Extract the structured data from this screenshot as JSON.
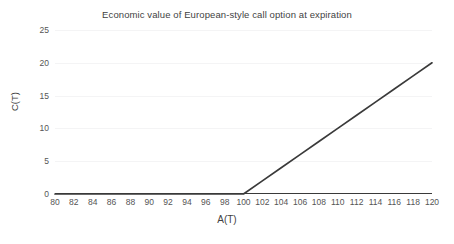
{
  "chart_data": {
    "type": "line",
    "title": "Economic value of European-style call option at expiration",
    "xlabel": "A(T)",
    "ylabel": "C(T)",
    "xlim": [
      80,
      120
    ],
    "ylim": [
      0,
      25
    ],
    "grid": true,
    "legend": null,
    "xticks": [
      80,
      82,
      84,
      86,
      88,
      90,
      92,
      94,
      96,
      98,
      100,
      102,
      104,
      106,
      108,
      110,
      112,
      114,
      116,
      118,
      120
    ],
    "yticks": [
      0,
      5,
      10,
      15,
      20,
      25
    ],
    "series": [
      {
        "name": "C(T) = max(A(T) - 100, 0)",
        "color": "#3a3a3a",
        "x": [
          80,
          82,
          84,
          86,
          88,
          90,
          92,
          94,
          96,
          98,
          100,
          102,
          104,
          106,
          108,
          110,
          112,
          114,
          116,
          118,
          120
        ],
        "values": [
          0,
          0,
          0,
          0,
          0,
          0,
          0,
          0,
          0,
          0,
          0,
          2,
          4,
          6,
          8,
          10,
          12,
          14,
          16,
          18,
          20
        ]
      }
    ],
    "annotations": {
      "strike": 100,
      "kink_point": [
        100,
        0
      ],
      "end_point": [
        120,
        20
      ]
    }
  },
  "colors": {
    "background": "#ffffff",
    "line": "#3a3a3a",
    "grid": "#f4f4f5",
    "axis": "#3a3a3a",
    "text": "#555555",
    "title_text": "#3f3f3f"
  }
}
